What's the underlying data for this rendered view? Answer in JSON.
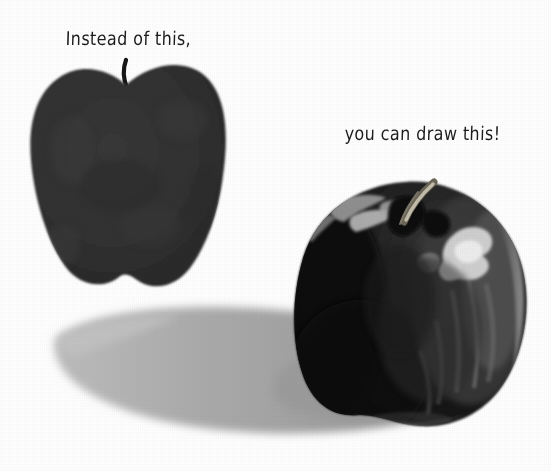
{
  "page": {
    "background_color": "#ffffff",
    "width": 551,
    "height": 471
  },
  "captions": {
    "left": {
      "text": "Instead of this,",
      "color": "#1c1c1c",
      "x": 66,
      "y": 27
    },
    "right": {
      "text": "you can draw this!",
      "color": "#1c1c1c",
      "x": 345,
      "y": 122
    }
  },
  "objects": {
    "flat_apple": {
      "label": "flat silhouette apple",
      "body_color": "#2e2e2e",
      "stem_color": "#151515",
      "x": 25,
      "y": 60,
      "width": 200,
      "height": 230
    },
    "shaded_apple": {
      "label": "shaded rendered apple",
      "body_color": "#141414",
      "dark_color": "#0b0b0b",
      "midtone_color": "#4a4a4a",
      "highlight_color": "#d9d9d9",
      "stem_color": "#b9b4a6",
      "x": 293,
      "y": 176,
      "width": 232,
      "height": 250
    },
    "cast_shadow": {
      "label": "cast shadow",
      "color": "#a8a8a8",
      "x": 58,
      "y": 308,
      "width": 420,
      "height": 130
    }
  }
}
